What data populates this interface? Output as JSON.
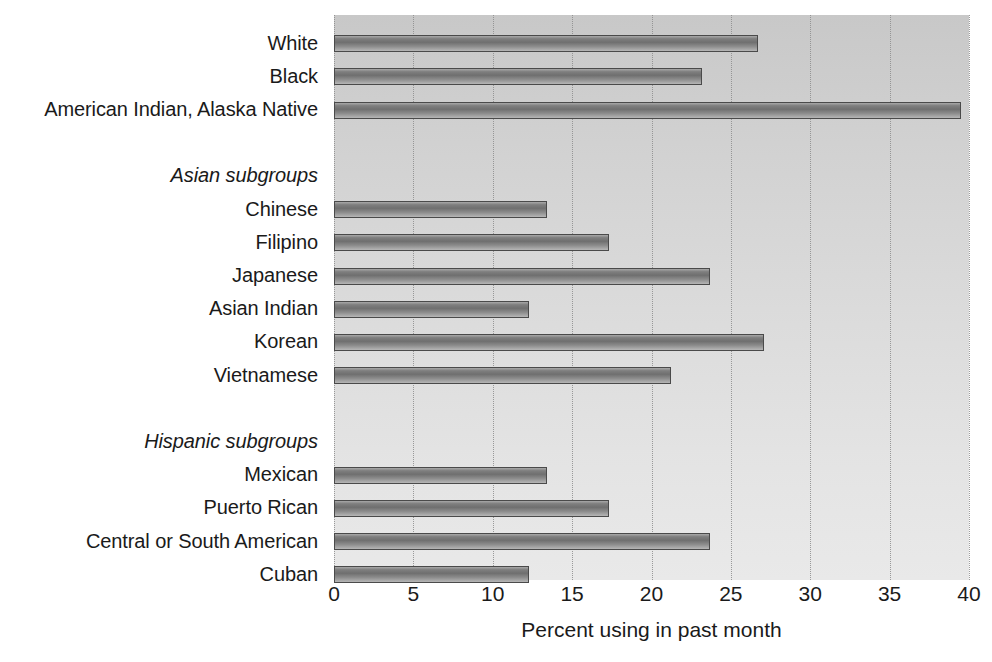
{
  "chart_data": {
    "type": "bar",
    "orientation": "horizontal",
    "title": "",
    "subtitle": "",
    "xlabel": "Percent using in past month",
    "ylabel": "",
    "xlim": [
      0,
      40
    ],
    "xticks": [
      0,
      5,
      10,
      15,
      20,
      25,
      30,
      35,
      40
    ],
    "xtick_labels": [
      "0",
      "5",
      "10",
      "15",
      "20",
      "25",
      "30",
      "35",
      "40"
    ],
    "grid": true,
    "grid_axis": "x",
    "grid_style": "dotted",
    "legend": false,
    "legend_position": "none",
    "bar_color": "#808080",
    "bar_edge_color": "#4a4a4a",
    "plot_background": "#d8d8d8",
    "categories": [
      "White",
      "Black",
      "American Indian, Alaska Native",
      "",
      "Asian subgroups",
      "Chinese",
      "Filipino",
      "Japanese",
      "Asian Indian",
      "Korean",
      "Vietnamese",
      "",
      "Hispanic subgroups",
      "Mexican",
      "Puerto Rican",
      "Central or South American",
      "Cuban"
    ],
    "values": [
      26.7,
      23.2,
      39.5,
      null,
      null,
      13.4,
      17.3,
      23.7,
      12.3,
      27.1,
      21.2,
      null,
      null,
      13.4,
      17.3,
      23.7,
      12.3
    ],
    "rows": [
      {
        "label": "White",
        "value": 26.7,
        "kind": "bar"
      },
      {
        "label": "Black",
        "value": 23.2,
        "kind": "bar"
      },
      {
        "label": "American Indian, Alaska Native",
        "value": 39.5,
        "kind": "bar"
      },
      {
        "label": "",
        "value": null,
        "kind": "spacer"
      },
      {
        "label": "Asian subgroups",
        "value": null,
        "kind": "header"
      },
      {
        "label": "Chinese",
        "value": 13.4,
        "kind": "bar"
      },
      {
        "label": "Filipino",
        "value": 17.3,
        "kind": "bar"
      },
      {
        "label": "Japanese",
        "value": 23.7,
        "kind": "bar"
      },
      {
        "label": "Asian Indian",
        "value": 12.3,
        "kind": "bar"
      },
      {
        "label": "Korean",
        "value": 27.1,
        "kind": "bar"
      },
      {
        "label": "Vietnamese",
        "value": 21.2,
        "kind": "bar"
      },
      {
        "label": "",
        "value": null,
        "kind": "spacer"
      },
      {
        "label": "Hispanic subgroups",
        "value": null,
        "kind": "header"
      },
      {
        "label": "Mexican",
        "value": 13.4,
        "kind": "bar"
      },
      {
        "label": "Puerto Rican",
        "value": 17.3,
        "kind": "bar"
      },
      {
        "label": "Central or South American",
        "value": 23.7,
        "kind": "bar"
      },
      {
        "label": "Cuban",
        "value": 12.3,
        "kind": "bar"
      }
    ]
  }
}
